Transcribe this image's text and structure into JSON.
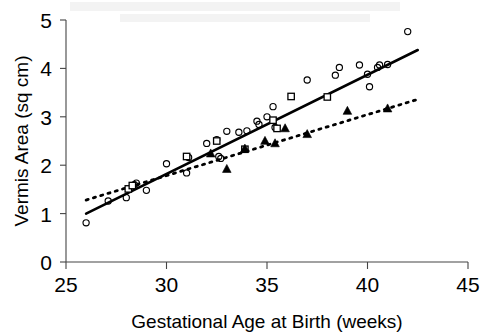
{
  "chart_data": {
    "type": "scatter",
    "title": "",
    "xlabel": "Gestational Age at Birth (weeks)",
    "ylabel": "Vermis Area (sq cm)",
    "xlim": [
      25,
      45
    ],
    "ylim": [
      0,
      5
    ],
    "xticks": [
      25,
      30,
      35,
      40,
      45
    ],
    "yticks": [
      0,
      1,
      2,
      3,
      4,
      5
    ],
    "xtick_labels": [
      "25",
      "30",
      "35",
      "40",
      "45"
    ],
    "ytick_labels": [
      "0",
      "1",
      "2",
      "3",
      "4",
      "5"
    ],
    "grid": false,
    "legend": "none",
    "marker_color": "#000000",
    "series": [
      {
        "name": "open-circles",
        "marker": "circle-open",
        "points": [
          [
            26.0,
            0.81
          ],
          [
            27.1,
            1.26
          ],
          [
            28.0,
            1.33
          ],
          [
            28.4,
            1.6
          ],
          [
            28.5,
            1.63
          ],
          [
            29.0,
            1.48
          ],
          [
            30.0,
            2.03
          ],
          [
            31.0,
            1.84
          ],
          [
            31.1,
            2.16
          ],
          [
            32.0,
            2.45
          ],
          [
            32.5,
            2.53
          ],
          [
            32.6,
            2.18
          ],
          [
            32.7,
            2.14
          ],
          [
            33.0,
            2.7
          ],
          [
            33.6,
            2.68
          ],
          [
            34.0,
            2.71
          ],
          [
            34.5,
            2.91
          ],
          [
            34.6,
            2.84
          ],
          [
            35.0,
            3.0
          ],
          [
            35.3,
            3.21
          ],
          [
            35.4,
            2.78
          ],
          [
            37.0,
            3.76
          ],
          [
            38.4,
            3.86
          ],
          [
            38.6,
            4.02
          ],
          [
            39.6,
            4.07
          ],
          [
            40.0,
            3.88
          ],
          [
            40.1,
            3.62
          ],
          [
            40.5,
            4.02
          ],
          [
            40.6,
            4.07
          ],
          [
            41.0,
            4.08
          ],
          [
            42.0,
            4.76
          ]
        ]
      },
      {
        "name": "open-squares",
        "marker": "square-open",
        "points": [
          [
            28.1,
            1.51
          ],
          [
            28.3,
            1.58
          ],
          [
            31.0,
            2.18
          ],
          [
            32.5,
            2.5
          ],
          [
            33.9,
            2.33
          ],
          [
            35.3,
            2.93
          ],
          [
            35.5,
            2.76
          ],
          [
            36.2,
            3.42
          ],
          [
            38.0,
            3.41
          ]
        ]
      },
      {
        "name": "filled-triangles",
        "marker": "triangle-filled",
        "points": [
          [
            32.2,
            2.24
          ],
          [
            33.0,
            1.92
          ],
          [
            33.9,
            2.34
          ],
          [
            34.9,
            2.5
          ],
          [
            35.4,
            2.45
          ],
          [
            35.9,
            2.76
          ],
          [
            37.0,
            2.64
          ],
          [
            39.0,
            3.12
          ],
          [
            41.0,
            3.17
          ]
        ]
      }
    ],
    "trendlines": [
      {
        "name": "solid-regression-line",
        "style": "solid",
        "x": [
          26.0,
          42.5
        ],
        "y": [
          1.0,
          4.38
        ]
      },
      {
        "name": "dotted-regression-line",
        "style": "dotted",
        "x": [
          26.0,
          42.5
        ],
        "y": [
          1.28,
          3.36
        ]
      }
    ]
  },
  "axes": {
    "y_title": "Vermis Area (sq cm)",
    "x_title": "Gestational Age at Birth (weeks)"
  }
}
